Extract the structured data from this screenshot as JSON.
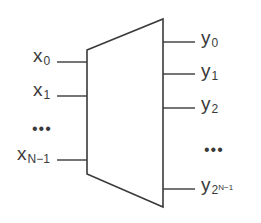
{
  "diagram": {
    "type": "decoder-block",
    "stroke_color": "#3a3a3a",
    "background": "#ffffff",
    "block": {
      "shape": "trapezoid",
      "left_edge": {
        "x": 87,
        "y_top": 50,
        "y_bottom": 174
      },
      "right_edge": {
        "x": 163,
        "y_top": 19,
        "y_bottom": 207
      }
    },
    "inputs": [
      {
        "base": "x",
        "sub": "0",
        "y": 62
      },
      {
        "base": "x",
        "sub": "1",
        "y": 96
      },
      {
        "base": "x",
        "sub": "N−1",
        "y": 160
      }
    ],
    "inputs_ellipsis": "•••",
    "outputs": [
      {
        "base": "y",
        "sub": "0",
        "y": 42
      },
      {
        "base": "y",
        "sub": "1",
        "y": 74
      },
      {
        "base": "y",
        "sub": "2",
        "y": 108
      },
      {
        "base": "y",
        "sub": "2",
        "sup": "N−1",
        "y": 189
      }
    ],
    "outputs_ellipsis": "•••"
  }
}
